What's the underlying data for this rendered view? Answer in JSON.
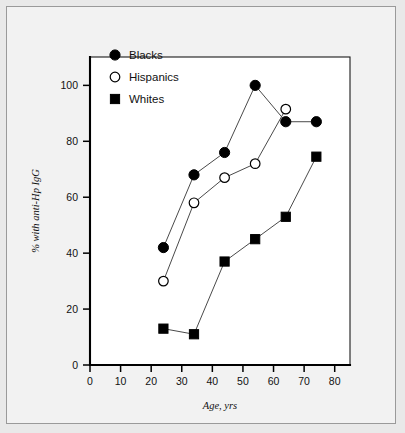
{
  "chart_data": {
    "type": "line",
    "title": "",
    "xlabel": "Age, yrs",
    "ylabel": "% with anti-Hp IgG",
    "xlim": [
      0,
      85
    ],
    "ylim": [
      0,
      108
    ],
    "xticks": [
      0,
      10,
      20,
      30,
      40,
      50,
      60,
      70,
      80
    ],
    "yticks": [
      0,
      20,
      40,
      60,
      80,
      100
    ],
    "xticklabels": [
      "0",
      "10",
      "20",
      "30",
      "40",
      "50",
      "60",
      "70",
      "80"
    ],
    "yticklabels": [
      "0",
      "20",
      "40",
      "60",
      "80",
      "100"
    ],
    "grid": false,
    "legend_position": "top-left",
    "series": [
      {
        "name": "Blacks",
        "marker": "filled-circle",
        "color": "#000000",
        "x": [
          24,
          34,
          44,
          54,
          64,
          74
        ],
        "values": [
          42,
          68,
          76,
          100,
          87,
          87
        ]
      },
      {
        "name": "Hispanics",
        "marker": "open-circle",
        "color": "#ffffff",
        "x": [
          24,
          34,
          44,
          54,
          64
        ],
        "values": [
          30,
          58,
          67,
          72,
          91.5
        ]
      },
      {
        "name": "Whites",
        "marker": "filled-square",
        "color": "#000000",
        "x": [
          24,
          34,
          44,
          54,
          64,
          74
        ],
        "values": [
          13,
          11,
          37,
          45,
          53,
          74.5
        ]
      }
    ]
  },
  "legend": {
    "items": [
      {
        "label": "Blacks",
        "marker": "filled-circle"
      },
      {
        "label": "Hispanics",
        "marker": "open-circle"
      },
      {
        "label": "Whites",
        "marker": "filled-square"
      }
    ]
  },
  "colors": {
    "page_background": "#e9e9e9",
    "figure_background": "#f2f2f2",
    "plot_background": "#ffffff",
    "axis": "#000000",
    "line": "#4a4a4a",
    "text": "#111111"
  }
}
